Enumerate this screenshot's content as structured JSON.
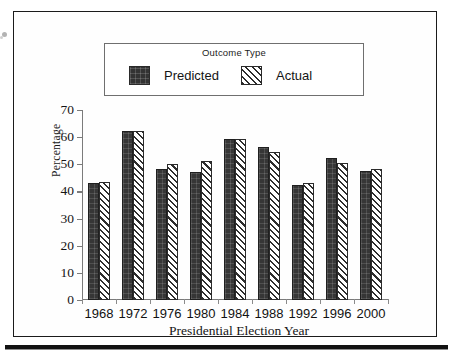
{
  "figure": {
    "legend_title": "Outcome Type",
    "series_labels": [
      "Predicted",
      "Actual"
    ],
    "y_axis_title": "Percentage",
    "x_axis_title": "Presidential Election Year"
  },
  "chart_data": {
    "type": "bar",
    "title": "",
    "subtitle": "",
    "xlabel": "Presidential Election Year",
    "ylabel": "Percentage",
    "categories": [
      "1968",
      "1972",
      "1976",
      "1980",
      "1984",
      "1988",
      "1992",
      "1996",
      "2000"
    ],
    "series": [
      {
        "name": "Predicted",
        "values": [
          43.0,
          62.2,
          48.3,
          47.3,
          59.3,
          56.2,
          42.2,
          52.3,
          47.5
        ],
        "fill": "solid-dark",
        "color": "#363636"
      },
      {
        "name": "Actual",
        "values": [
          43.5,
          62.2,
          50.2,
          51.1,
          59.4,
          54.4,
          43.2,
          50.3,
          48.3
        ],
        "fill": "diagonal-hatch",
        "color": "#2e2e2e"
      }
    ],
    "ylim": [
      0,
      70
    ],
    "yticks": [
      0,
      10,
      20,
      30,
      40,
      50,
      60,
      70
    ],
    "ytick_labels": [
      "0",
      "10",
      "20",
      "30",
      "40",
      "50",
      "60",
      "70"
    ],
    "grid": false,
    "legend_position": "top-inside",
    "legend_title": "Outcome Type"
  }
}
